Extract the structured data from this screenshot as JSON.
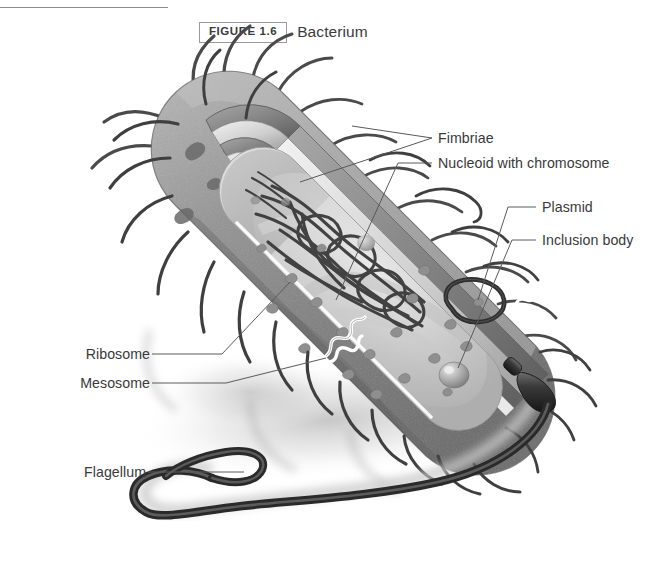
{
  "figure": {
    "number_label": "FIGURE 1.6",
    "title": "Bacterium"
  },
  "labels": {
    "fimbriae": "Fimbriae",
    "nucleoid": "Nucleoid with chromosome",
    "plasmid": "Plasmid",
    "inclusion_body": "Inclusion body",
    "ribosome": "Ribosome",
    "mesosome": "Mesosome",
    "flagellum": "Flagellum"
  },
  "colors": {
    "text": "#3a3a3a",
    "rule": "#8c8c8c",
    "box_border": "#9a9a9a",
    "leader_line": "#5a5a5a",
    "wall_outer": "#8e8e8e",
    "wall_dark": "#6f6f6f",
    "capsule_light": "#e9e9e9",
    "cytoplasm": "#d2d2d2",
    "cytoplasm_light": "#e4e4e4",
    "dna": "#3b3b3b",
    "flagellum": "#3a3a3a",
    "shadow": "#c9c9c9",
    "background": "#ffffff"
  },
  "diagram": {
    "organism": "rod-shaped bacterium (bacillus), cut-away view",
    "structures": [
      "fimbriae",
      "cell wall",
      "plasma membrane",
      "capsule",
      "nucleoid with chromosome",
      "ribosomes",
      "plasmid",
      "inclusion body",
      "mesosome",
      "flagellum"
    ]
  }
}
